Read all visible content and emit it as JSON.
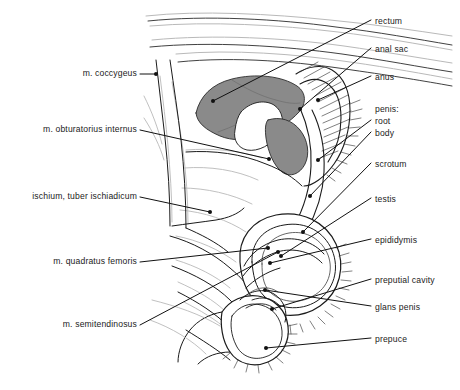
{
  "figure": {
    "background_color": "#ffffff",
    "line_color": "#1b1b1b",
    "shade_color": "#8a8a8a",
    "light_line_color": "#b9b9b9",
    "leader_color": "#111111"
  },
  "labels_left": [
    {
      "id": "m-coccygeus",
      "text": "m. coccygeus",
      "x": 137,
      "y": 74,
      "tip_x": 156,
      "tip_y": 74
    },
    {
      "id": "m-obturatorius-internus",
      "text": "m. obturatorius internus",
      "x": 137,
      "y": 130,
      "tip_x": 269,
      "tip_y": 159
    },
    {
      "id": "ischium-tuber-ischiadicum",
      "text": "ischium, tuber ischiadicum",
      "x": 137,
      "y": 197,
      "tip_x": 210,
      "tip_y": 212
    },
    {
      "id": "m-quadratus-femoris",
      "text": "m. quadratus femoris",
      "x": 137,
      "y": 262,
      "tip_x": 268,
      "tip_y": 248
    },
    {
      "id": "m-semitendinosus",
      "text": "m. semitendinosus",
      "x": 137,
      "y": 325,
      "tip_x": 278,
      "tip_y": 252
    }
  ],
  "labels_right": [
    {
      "id": "rectum",
      "text": "rectum",
      "x": 375,
      "y": 22,
      "tip_x": 213,
      "tip_y": 101
    },
    {
      "id": "anal-sac",
      "text": "anal sac",
      "x": 375,
      "y": 50,
      "tip_x": 300,
      "tip_y": 109
    },
    {
      "id": "anus",
      "text": "anus",
      "x": 375,
      "y": 78,
      "tip_x": 318,
      "tip_y": 100
    },
    {
      "id": "penis-heading",
      "text": "penis:",
      "x": 375,
      "y": 110,
      "tip_x": null,
      "tip_y": null
    },
    {
      "id": "penis-root",
      "text": "root",
      "x": 375,
      "y": 122,
      "tip_x": 318,
      "tip_y": 160
    },
    {
      "id": "penis-body",
      "text": "body",
      "x": 375,
      "y": 134,
      "tip_x": 310,
      "tip_y": 196
    },
    {
      "id": "scrotum",
      "text": "scrotum",
      "x": 375,
      "y": 165,
      "tip_x": 303,
      "tip_y": 232
    },
    {
      "id": "testis",
      "text": "testis",
      "x": 375,
      "y": 200,
      "tip_x": 281,
      "tip_y": 256
    },
    {
      "id": "epididymis",
      "text": "epididymis",
      "x": 375,
      "y": 241,
      "tip_x": 270,
      "tip_y": 263
    },
    {
      "id": "preputial-cavity",
      "text": "preputial cavity",
      "x": 375,
      "y": 281,
      "tip_x": 272,
      "tip_y": 309
    },
    {
      "id": "glans-penis",
      "text": "glans penis",
      "x": 375,
      "y": 308,
      "tip_x": 265,
      "tip_y": 290
    },
    {
      "id": "prepuce",
      "text": "prepuce",
      "x": 375,
      "y": 340,
      "tip_x": 266,
      "tip_y": 348
    }
  ],
  "shaded_regions": [
    {
      "id": "rectum-shade",
      "name": "rectum-and-anal-canal-shading",
      "color": "#8a8a8a"
    },
    {
      "id": "analsac-shade",
      "name": "anal-sac-shading",
      "color": "#8a8a8a"
    }
  ]
}
